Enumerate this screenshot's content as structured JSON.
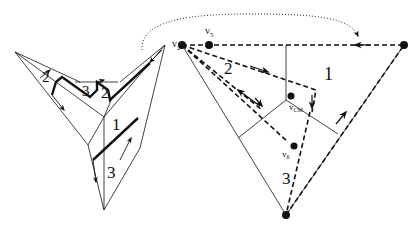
{
  "figure": {
    "left_panel": {
      "region_labels": [
        "2",
        "3",
        "2",
        "1",
        "3"
      ]
    },
    "right_panel": {
      "vertices": {
        "v2": "v",
        "v2_sub": "2",
        "v5": "v",
        "v5_sub": "5",
        "vcm": "v",
        "vcm_sub": "CM",
        "v6": "v",
        "v6_sub": "6"
      },
      "region_labels": [
        "2",
        "1",
        "3"
      ]
    },
    "colors": {
      "stroke": "#111111",
      "background": "#ffffff"
    }
  }
}
